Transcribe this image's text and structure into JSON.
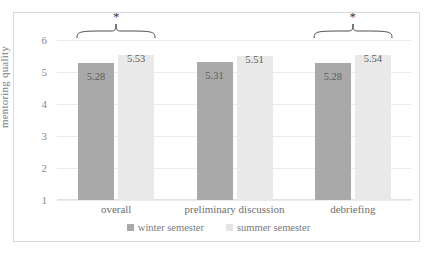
{
  "chart_data": {
    "type": "bar",
    "title": "",
    "xlabel": "",
    "ylabel": "mentoring quality",
    "ylim": [
      1,
      6
    ],
    "yticks": [
      "6",
      "5",
      "4",
      "3",
      "2",
      "1"
    ],
    "grid": true,
    "legend_position": "bottom",
    "categories": [
      "overall",
      "preliminary discussion",
      "debriefing"
    ],
    "series": [
      {
        "name": "winter semester",
        "color": "#a9a9a9",
        "values": [
          5.28,
          5.31,
          5.28
        ],
        "labels": [
          "5.28",
          "5.31",
          "5.28"
        ]
      },
      {
        "name": "summer semester",
        "color": "#e9e9e9",
        "values": [
          5.53,
          5.51,
          5.54
        ],
        "labels": [
          "5.53",
          "5.51",
          "5.54"
        ]
      }
    ],
    "annotations": [
      {
        "name": "significance-bracket-overall",
        "group": "overall",
        "marker": "*"
      },
      {
        "name": "significance-bracket-debriefing",
        "group": "debriefing",
        "marker": "*"
      }
    ]
  },
  "colors": {
    "winter": "#a9a9a9",
    "summer": "#e9e9e9",
    "grid": "#ececec",
    "frame": "#d9d9d9",
    "text": "#6f6f6f"
  }
}
